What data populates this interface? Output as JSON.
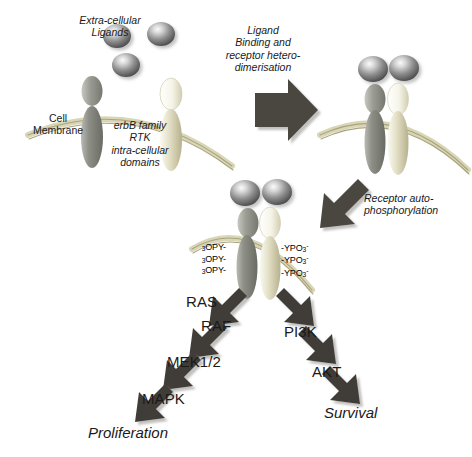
{
  "diagram": {
    "background": "#ffffff",
    "colors": {
      "membrane": "#b5b189",
      "membrane_light": "#d9d6b8",
      "receptor_grey_dark": "#6f7069",
      "receptor_grey_light": "#b9bab2",
      "receptor_tan_dark": "#bdb896",
      "receptor_tan_light": "#f2f0e2",
      "ligand_dark": "#4c4c4c",
      "ligand_light": "#f2f2f2",
      "arrow_fill": "#4a4740",
      "arrow_shadow": "#b9b7b2",
      "text": "#1a1a1a"
    }
  },
  "stage1": {
    "ligand_label": "Extra-cellular\nLigands",
    "membrane_label": "Cell\nMembrane",
    "receptor_label": "erbB family\nRTK\nintra-cellular\ndomains",
    "ligands": [
      {
        "name": "ligand-1",
        "cx": 117,
        "cy": 36,
        "rx": 14,
        "ry": 12
      },
      {
        "name": "ligand-2",
        "cx": 161,
        "cy": 34,
        "rx": 14,
        "ry": 12
      },
      {
        "name": "ligand-3",
        "cx": 126,
        "cy": 65,
        "rx": 14,
        "ry": 12
      }
    ]
  },
  "stage2": {
    "step_label": "Ligand\nBinding and\nreceptor hetero-\ndimerisation",
    "arrow_name": "right-arrow-dimerisation"
  },
  "stage3": {
    "step_label": "Receptor auto-\nphosphorylation",
    "arrow_name": "down-left-arrow-phosphorylation",
    "phospho_left": [
      "₃OPY-",
      "₃OPY-",
      "₃OPY-"
    ],
    "phospho_right": [
      "-YPO₃",
      "-YPO₃",
      "-YPO₃"
    ],
    "phospho_left_parts": [
      {
        "sub": "3",
        "text": "OPY-"
      },
      {
        "sub": "3",
        "text": "OPY-"
      },
      {
        "sub": "3",
        "text": "OPY-"
      }
    ],
    "phospho_right_parts": [
      {
        "text": "-YPO",
        "sub": "3",
        "sup": "-"
      },
      {
        "text": "-YPO",
        "sub": "3",
        "sup": "-"
      },
      {
        "text": "-YPO",
        "sub": "3",
        "sup": "-"
      }
    ]
  },
  "cascade": {
    "mapk_branch": {
      "name": "mapk-branch",
      "steps": [
        {
          "label": "RAS",
          "x": 186,
          "y": 293
        },
        {
          "label": "RAF",
          "x": 201,
          "y": 317
        },
        {
          "label": "MEK1/2",
          "x": 167,
          "y": 353
        },
        {
          "label": "MAPK",
          "x": 142,
          "y": 390
        }
      ],
      "outcome": {
        "label": "Proliferation",
        "x": 88,
        "y": 424
      }
    },
    "pi3k_branch": {
      "name": "pi3k-branch",
      "steps": [
        {
          "label": "PI3K",
          "x": 284,
          "y": 323
        },
        {
          "label": "AKT",
          "x": 312,
          "y": 363
        }
      ],
      "outcome": {
        "label": "Survival",
        "x": 324,
        "y": 404
      }
    }
  }
}
